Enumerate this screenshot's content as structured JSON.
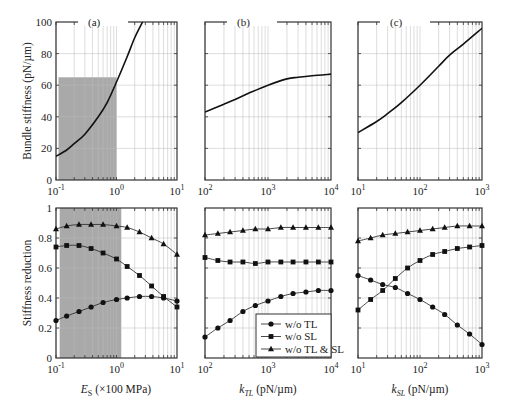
{
  "chart_data": [
    {
      "type": "line",
      "panel": "(a)",
      "xlabel": "",
      "ylabel": "Bundle stiffness (pN/µm)",
      "xscale": "log",
      "xlim": [
        0.1,
        10
      ],
      "ylim": [
        0,
        100
      ],
      "xticks": [
        "10^-1",
        "10^0",
        "10^1"
      ],
      "yticks": [
        "0",
        "20",
        "40",
        "60",
        "80",
        "100"
      ],
      "shaded_region": {
        "x": [
          0.11,
          1.0
        ],
        "y": [
          0,
          65
        ]
      },
      "series": [
        {
          "name": "bundle stiffness",
          "x": [
            0.1,
            0.15,
            0.2,
            0.3,
            0.5,
            0.7,
            1.0,
            1.5,
            2.0,
            2.7
          ],
          "y": [
            15,
            19,
            23,
            29,
            40,
            49,
            62,
            78,
            90,
            100
          ]
        }
      ]
    },
    {
      "type": "line",
      "panel": "(b)",
      "xlabel": "",
      "ylabel": "",
      "xscale": "log",
      "xlim": [
        100,
        10000
      ],
      "ylim": [
        0,
        100
      ],
      "xticks": [
        "10^2",
        "10^3",
        "10^4"
      ],
      "series": [
        {
          "name": "bundle stiffness",
          "x": [
            100,
            200,
            300,
            500,
            1000,
            2000,
            3000,
            5000,
            10000
          ],
          "y": [
            43,
            48,
            51,
            55,
            60,
            64,
            65,
            66,
            67
          ]
        }
      ]
    },
    {
      "type": "line",
      "panel": "(c)",
      "xlabel": "",
      "ylabel": "",
      "xscale": "log",
      "xlim": [
        10,
        1000
      ],
      "ylim": [
        0,
        100
      ],
      "xticks": [
        "10^1",
        "10^2",
        "10^3"
      ],
      "series": [
        {
          "name": "bundle stiffness",
          "x": [
            10,
            20,
            30,
            50,
            100,
            200,
            300,
            500,
            1000
          ],
          "y": [
            30,
            37,
            42,
            49,
            60,
            72,
            79,
            86,
            96
          ]
        }
      ]
    },
    {
      "type": "line",
      "panel": "(a) lower",
      "xlabel": "E_S (×100 MPa)",
      "ylabel": "Stiffness reduction",
      "xscale": "log",
      "xlim": [
        0.1,
        10
      ],
      "ylim": [
        0,
        1
      ],
      "xticks": [
        "10^-1",
        "10^0",
        "10^1"
      ],
      "yticks": [
        "0",
        "0.2",
        "0.4",
        "0.6",
        "0.8",
        "1"
      ],
      "shaded_region": {
        "x": [
          0.115,
          1.2
        ],
        "y": [
          0,
          1
        ]
      },
      "series": [
        {
          "name": "w/o TL",
          "marker": "circle",
          "x": [
            0.1,
            0.15,
            0.24,
            0.38,
            0.6,
            1.0,
            1.5,
            2.4,
            3.8,
            6.0,
            10
          ],
          "y": [
            0.25,
            0.28,
            0.31,
            0.34,
            0.37,
            0.39,
            0.4,
            0.41,
            0.41,
            0.4,
            0.38
          ]
        },
        {
          "name": "w/o SL",
          "marker": "square",
          "x": [
            0.1,
            0.15,
            0.24,
            0.38,
            0.6,
            1.0,
            1.5,
            2.4,
            3.8,
            6.0,
            10
          ],
          "y": [
            0.74,
            0.75,
            0.75,
            0.73,
            0.7,
            0.66,
            0.61,
            0.55,
            0.48,
            0.41,
            0.34
          ]
        },
        {
          "name": "w/o TL & SL",
          "marker": "triangle",
          "x": [
            0.1,
            0.15,
            0.24,
            0.38,
            0.6,
            1.0,
            1.5,
            2.4,
            3.8,
            6.0,
            10
          ],
          "y": [
            0.86,
            0.88,
            0.89,
            0.89,
            0.89,
            0.88,
            0.87,
            0.84,
            0.8,
            0.76,
            0.69
          ]
        }
      ]
    },
    {
      "type": "line",
      "panel": "(b) lower",
      "xlabel": "k_TL (pN/µm)",
      "ylabel": "",
      "xscale": "log",
      "xlim": [
        100,
        10000
      ],
      "ylim": [
        0,
        1
      ],
      "xticks": [
        "10^2",
        "10^3",
        "10^4"
      ],
      "legend": {
        "position": "lower right",
        "entries": [
          "w/o TL",
          "w/o SL",
          "w/o TL & SL"
        ]
      },
      "series": [
        {
          "name": "w/o TL",
          "marker": "circle",
          "x": [
            100,
            160,
            250,
            400,
            630,
            1000,
            1600,
            2500,
            4000,
            6300,
            10000
          ],
          "y": [
            0.14,
            0.2,
            0.25,
            0.31,
            0.35,
            0.38,
            0.41,
            0.43,
            0.44,
            0.45,
            0.45
          ]
        },
        {
          "name": "w/o SL",
          "marker": "square",
          "x": [
            100,
            160,
            250,
            400,
            630,
            1000,
            1600,
            2500,
            4000,
            6300,
            10000
          ],
          "y": [
            0.67,
            0.65,
            0.64,
            0.64,
            0.63,
            0.64,
            0.64,
            0.64,
            0.64,
            0.64,
            0.64
          ]
        },
        {
          "name": "w/o TL & SL",
          "marker": "triangle",
          "x": [
            100,
            160,
            250,
            400,
            630,
            1000,
            1600,
            2500,
            4000,
            6300,
            10000
          ],
          "y": [
            0.82,
            0.83,
            0.84,
            0.85,
            0.86,
            0.86,
            0.87,
            0.87,
            0.87,
            0.87,
            0.87
          ]
        }
      ]
    },
    {
      "type": "line",
      "panel": "(c) lower",
      "xlabel": "k_SL (pN/µm)",
      "ylabel": "",
      "xscale": "log",
      "xlim": [
        10,
        1000
      ],
      "ylim": [
        0,
        1
      ],
      "xticks": [
        "10^1",
        "10^2",
        "10^3"
      ],
      "series": [
        {
          "name": "w/o TL",
          "marker": "circle",
          "x": [
            10,
            16,
            25,
            40,
            63,
            100,
            160,
            250,
            400,
            630,
            1000
          ],
          "y": [
            0.55,
            0.52,
            0.49,
            0.47,
            0.43,
            0.39,
            0.34,
            0.29,
            0.22,
            0.16,
            0.09
          ]
        },
        {
          "name": "w/o SL",
          "marker": "square",
          "x": [
            10,
            16,
            25,
            40,
            63,
            100,
            160,
            250,
            400,
            630,
            1000
          ],
          "y": [
            0.32,
            0.39,
            0.45,
            0.53,
            0.6,
            0.65,
            0.69,
            0.71,
            0.73,
            0.74,
            0.75
          ]
        },
        {
          "name": "w/o TL & SL",
          "marker": "triangle",
          "x": [
            10,
            16,
            25,
            40,
            63,
            100,
            160,
            250,
            400,
            630,
            1000
          ],
          "y": [
            0.78,
            0.8,
            0.82,
            0.83,
            0.84,
            0.85,
            0.86,
            0.87,
            0.88,
            0.88,
            0.88
          ]
        }
      ]
    }
  ],
  "labels": {
    "panel_a": "(a)",
    "panel_b": "(b)",
    "panel_c": "(c)",
    "ylabel_top": "Bundle stiffness (pN/µm)",
    "ylabel_bottom": "Stiffness reduction",
    "xlabel_a_main": "E",
    "xlabel_a_sub": "S",
    "xlabel_a_rest": " (×100 MPa)",
    "xlabel_b_main": "k",
    "xlabel_b_sub": "TL",
    "xlabel_b_rest": " (pN/µm)",
    "xlabel_c_main": "k",
    "xlabel_c_sub": "SL",
    "xlabel_c_rest": " (pN/µm)",
    "ytick_top": [
      "0",
      "20",
      "40",
      "60",
      "80",
      "100"
    ],
    "ytick_bottom": [
      "0",
      "0.2",
      "0.4",
      "0.6",
      "0.8",
      "1"
    ],
    "xtick_a": [
      "10",
      "-1",
      "10",
      "0",
      "10",
      "1"
    ],
    "xtick_b": [
      "10",
      "2",
      "10",
      "3",
      "10",
      "4"
    ],
    "xtick_c": [
      "10",
      "1",
      "10",
      "2",
      "10",
      "3"
    ],
    "legend": [
      "w/o TL",
      "w/o SL",
      "w/o TL & SL"
    ]
  },
  "colors": {
    "shade": "#a9a9a9",
    "line": "#111111",
    "grid": "#bbbbbb"
  }
}
